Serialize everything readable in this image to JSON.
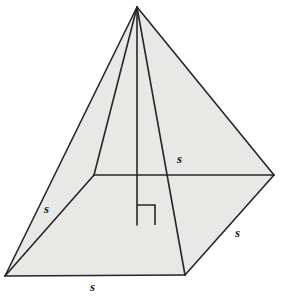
{
  "figure": {
    "name": "square-pyramid-diagram",
    "colors": {
      "background": "#ffffff",
      "face_fill": "#e8e8e6",
      "base_fill": "#e5e5e3",
      "stroke": "#262626",
      "label": "#1a1a1a"
    },
    "stroke_width": 1.6,
    "vertices": {
      "apex": {
        "x": 137,
        "y": 7
      },
      "base_left": {
        "x": 5,
        "y": 276
      },
      "base_front": {
        "x": 185,
        "y": 275
      },
      "base_right": {
        "x": 274,
        "y": 175
      },
      "base_back": {
        "x": 94,
        "y": 175
      },
      "altitude_foot": {
        "x": 137,
        "y": 225
      }
    },
    "right_angle_mark": {
      "name": "right-angle-mark",
      "points": "137,205 155,205 155,225",
      "size": 18
    },
    "labels": [
      {
        "id": "label-top-right-edge",
        "text": "s",
        "x": 177,
        "y": 152
      },
      {
        "id": "label-left-edge",
        "text": "s",
        "x": 44,
        "y": 202
      },
      {
        "id": "label-right-edge",
        "text": "s",
        "x": 235,
        "y": 226
      },
      {
        "id": "label-bottom-edge",
        "text": "s",
        "x": 90,
        "y": 280
      }
    ],
    "faces": [
      {
        "id": "face-left",
        "name": "left-lateral-face",
        "points": "137,7 5,276 94,175"
      },
      {
        "id": "face-front-left",
        "name": "front-left-lateral-face",
        "points": "137,7 5,276 185,275"
      },
      {
        "id": "face-right",
        "name": "right-lateral-face",
        "points": "137,7 274,175 185,275"
      },
      {
        "id": "face-base",
        "name": "base-quadrilateral",
        "points": "5,276 94,175 274,175 185,275"
      }
    ],
    "edges": [
      {
        "id": "edge-apex-left",
        "name": "apex-to-base-left-edge",
        "x1": 137,
        "y1": 7,
        "x2": 5,
        "y2": 276
      },
      {
        "id": "edge-apex-back",
        "name": "apex-to-base-back-edge",
        "x1": 137,
        "y1": 7,
        "x2": 94,
        "y2": 175
      },
      {
        "id": "edge-apex-front",
        "name": "apex-to-base-front-edge",
        "x1": 137,
        "y1": 7,
        "x2": 185,
        "y2": 275
      },
      {
        "id": "edge-apex-right",
        "name": "apex-to-base-right-edge",
        "x1": 137,
        "y1": 7,
        "x2": 274,
        "y2": 175
      },
      {
        "id": "edge-left-back",
        "name": "base-left-to-back-edge",
        "x1": 5,
        "y1": 276,
        "x2": 94,
        "y2": 175
      },
      {
        "id": "edge-back-right",
        "name": "base-back-to-right-edge",
        "x1": 94,
        "y1": 175,
        "x2": 274,
        "y2": 175
      },
      {
        "id": "edge-right-front",
        "name": "base-right-to-front-edge",
        "x1": 274,
        "y1": 175,
        "x2": 185,
        "y2": 275
      },
      {
        "id": "edge-front-left",
        "name": "base-front-to-left-edge",
        "x1": 185,
        "y1": 275,
        "x2": 5,
        "y2": 276
      },
      {
        "id": "edge-altitude",
        "name": "altitude-height-segment",
        "x1": 137,
        "y1": 7,
        "x2": 137,
        "y2": 225
      }
    ]
  }
}
